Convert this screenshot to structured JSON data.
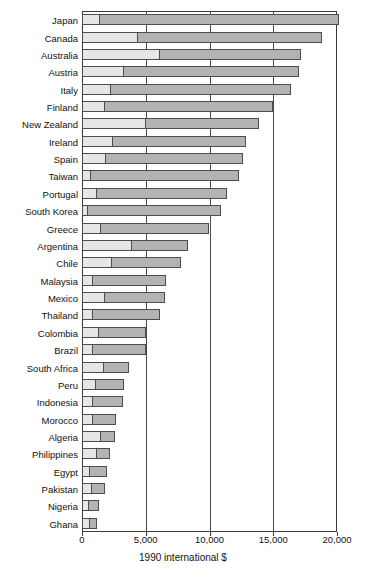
{
  "chart_data": {
    "type": "bar",
    "orientation": "horizontal",
    "stacked": true,
    "title": "",
    "subtitle": "",
    "xlabel": "1990 international $",
    "ylabel": "",
    "xlim": [
      0,
      20000
    ],
    "xticks": [
      0,
      5000,
      10000,
      15000,
      20000
    ],
    "xticklabels": [
      "0",
      "5,000",
      "10,000",
      "15,000",
      "20,000"
    ],
    "grid": "vertical",
    "legend": "none",
    "colors": {
      "segment_light": "#e6e6e6",
      "segment_dark": "#b3b3b3",
      "axis": "#3a3a3a",
      "background": "#ffffff"
    },
    "series": [
      {
        "name": "lower segment",
        "key": "light"
      },
      {
        "name": "upper segment",
        "key": "dark"
      }
    ],
    "categories": [
      "Japan",
      "Canada",
      "Australia",
      "Austria",
      "Italy",
      "Finland",
      "New Zealand",
      "Ireland",
      "Spain",
      "Taiwan",
      "Portugal",
      "South Korea",
      "Greece",
      "Argentina",
      "Chile",
      "Malaysia",
      "Mexico",
      "Thailand",
      "Colombia",
      "Brazil",
      "South Africa",
      "Peru",
      "Indonesia",
      "Morocco",
      "Algeria",
      "Philippines",
      "Egypt",
      "Pakistan",
      "Nigeria",
      "Ghana"
    ],
    "points": [
      {
        "category": "Japan",
        "light": 1450,
        "dark": 18700,
        "total": 20150
      },
      {
        "category": "Canada",
        "light": 4400,
        "dark": 14400,
        "total": 18800
      },
      {
        "category": "Australia",
        "light": 6100,
        "dark": 11100,
        "total": 17200
      },
      {
        "category": "Austria",
        "light": 3300,
        "dark": 13700,
        "total": 17000
      },
      {
        "category": "Italy",
        "light": 2250,
        "dark": 14150,
        "total": 16400
      },
      {
        "category": "Finland",
        "light": 1800,
        "dark": 13200,
        "total": 15000
      },
      {
        "category": "New Zealand",
        "light": 5000,
        "dark": 8900,
        "total": 13900
      },
      {
        "category": "Ireland",
        "light": 2400,
        "dark": 10500,
        "total": 12900
      },
      {
        "category": "Spain",
        "light": 1900,
        "dark": 10700,
        "total": 12600
      },
      {
        "category": "Taiwan",
        "light": 700,
        "dark": 11600,
        "total": 12300
      },
      {
        "category": "Portugal",
        "light": 1150,
        "dark": 10200,
        "total": 11350
      },
      {
        "category": "South Korea",
        "light": 500,
        "dark": 10400,
        "total": 10900
      },
      {
        "category": "Greece",
        "light": 1500,
        "dark": 8450,
        "total": 9950
      },
      {
        "category": "Argentina",
        "light": 3900,
        "dark": 4400,
        "total": 8300
      },
      {
        "category": "Chile",
        "light": 2350,
        "dark": 5450,
        "total": 7800
      },
      {
        "category": "Malaysia",
        "light": 900,
        "dark": 5650,
        "total": 6550
      },
      {
        "category": "Mexico",
        "light": 1800,
        "dark": 4700,
        "total": 6500
      },
      {
        "category": "Thailand",
        "light": 850,
        "dark": 5300,
        "total": 6150
      },
      {
        "category": "Colombia",
        "light": 1350,
        "dark": 3700,
        "total": 5050
      },
      {
        "category": "Brazil",
        "light": 900,
        "dark": 4100,
        "total": 5000
      },
      {
        "category": "South Africa",
        "light": 1750,
        "dark": 1950,
        "total": 3700
      },
      {
        "category": "Peru",
        "light": 1100,
        "dark": 2200,
        "total": 3300
      },
      {
        "category": "Indonesia",
        "light": 900,
        "dark": 2300,
        "total": 3200
      },
      {
        "category": "Morocco",
        "light": 900,
        "dark": 1800,
        "total": 2700
      },
      {
        "category": "Algeria",
        "light": 1500,
        "dark": 1100,
        "total": 2600
      },
      {
        "category": "Philippines",
        "light": 1200,
        "dark": 1000,
        "total": 2200
      },
      {
        "category": "Egypt",
        "light": 600,
        "dark": 1350,
        "total": 1950
      },
      {
        "category": "Pakistan",
        "light": 800,
        "dark": 1000,
        "total": 1800
      },
      {
        "category": "Nigeria",
        "light": 550,
        "dark": 750,
        "total": 1300
      },
      {
        "category": "Ghana",
        "light": 600,
        "dark": 600,
        "total": 1200
      }
    ]
  }
}
